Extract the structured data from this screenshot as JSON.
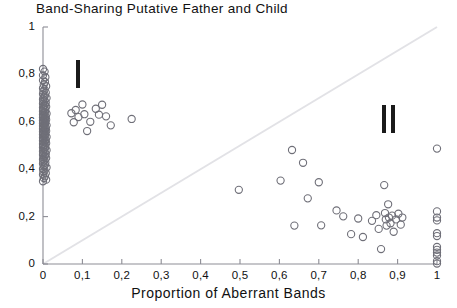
{
  "chart_data": {
    "type": "scatter",
    "title": "Band-Sharing Putative Father and Child",
    "xlabel": "Proportion of Aberrant Bands",
    "ylabel": "",
    "xlim": [
      0,
      1
    ],
    "ylim": [
      0,
      1
    ],
    "grid": false,
    "legend": "none",
    "xticks": [
      0,
      0.1,
      0.2,
      0.3,
      0.4,
      0.5,
      0.6,
      0.7,
      0.8,
      0.9,
      1
    ],
    "xticklabels": [
      "0",
      "0,1",
      "0,2",
      "0,3",
      "0,4",
      "0,5",
      "0,6",
      "0,7",
      "0,8",
      "0,9",
      "1"
    ],
    "yticks": [
      0,
      0.2,
      0.4,
      0.6,
      0.8,
      1
    ],
    "yticklabels": [
      "0",
      "0,2",
      "0,4",
      "0,6",
      "0,8",
      "1"
    ],
    "marker": "open-circle",
    "marker_color": "#6f6f78",
    "annotations": [
      {
        "text": "I",
        "bars": 1,
        "x": 0.09,
        "y": 0.8,
        "name": "cluster-label-i"
      },
      {
        "text": "II",
        "bars": 2,
        "x": 0.875,
        "y": 0.61,
        "name": "cluster-label-ii"
      }
    ],
    "reference_line": {
      "name": "diagonal-reference-line",
      "from": [
        0,
        0
      ],
      "to": [
        1,
        1
      ],
      "color": "#e2e2e6"
    },
    "series": [
      {
        "name": "putative father-child pairs",
        "points": [
          [
            0.0,
            0.823
          ],
          [
            0.004,
            0.812
          ],
          [
            0.0,
            0.796
          ],
          [
            0.006,
            0.788
          ],
          [
            0.0,
            0.775
          ],
          [
            0.005,
            0.768
          ],
          [
            0.002,
            0.757
          ],
          [
            0.008,
            0.75
          ],
          [
            0.0,
            0.742
          ],
          [
            0.004,
            0.736
          ],
          [
            0.001,
            0.729
          ],
          [
            0.007,
            0.723
          ],
          [
            0.0,
            0.717
          ],
          [
            0.005,
            0.711
          ],
          [
            0.002,
            0.705
          ],
          [
            0.009,
            0.7
          ],
          [
            0.0,
            0.695
          ],
          [
            0.004,
            0.69
          ],
          [
            0.001,
            0.685
          ],
          [
            0.007,
            0.681
          ],
          [
            0.0,
            0.676
          ],
          [
            0.005,
            0.672
          ],
          [
            0.002,
            0.668
          ],
          [
            0.008,
            0.664
          ],
          [
            0.0,
            0.66
          ],
          [
            0.004,
            0.656
          ],
          [
            0.001,
            0.652
          ],
          [
            0.006,
            0.648
          ],
          [
            0.0,
            0.645
          ],
          [
            0.005,
            0.641
          ],
          [
            0.002,
            0.638
          ],
          [
            0.009,
            0.634
          ],
          [
            0.0,
            0.631
          ],
          [
            0.004,
            0.628
          ],
          [
            0.001,
            0.624
          ],
          [
            0.007,
            0.621
          ],
          [
            0.0,
            0.618
          ],
          [
            0.005,
            0.615
          ],
          [
            0.002,
            0.612
          ],
          [
            0.008,
            0.609
          ],
          [
            0.0,
            0.606
          ],
          [
            0.004,
            0.603
          ],
          [
            0.001,
            0.6
          ],
          [
            0.006,
            0.597
          ],
          [
            0.0,
            0.594
          ],
          [
            0.005,
            0.591
          ],
          [
            0.002,
            0.588
          ],
          [
            0.009,
            0.585
          ],
          [
            0.0,
            0.582
          ],
          [
            0.004,
            0.579
          ],
          [
            0.001,
            0.576
          ],
          [
            0.007,
            0.573
          ],
          [
            0.0,
            0.57
          ],
          [
            0.005,
            0.567
          ],
          [
            0.002,
            0.564
          ],
          [
            0.008,
            0.561
          ],
          [
            0.0,
            0.558
          ],
          [
            0.004,
            0.555
          ],
          [
            0.001,
            0.552
          ],
          [
            0.006,
            0.549
          ],
          [
            0.0,
            0.546
          ],
          [
            0.005,
            0.543
          ],
          [
            0.002,
            0.54
          ],
          [
            0.009,
            0.536
          ],
          [
            0.0,
            0.533
          ],
          [
            0.004,
            0.53
          ],
          [
            0.001,
            0.527
          ],
          [
            0.007,
            0.523
          ],
          [
            0.0,
            0.52
          ],
          [
            0.005,
            0.517
          ],
          [
            0.002,
            0.513
          ],
          [
            0.008,
            0.51
          ],
          [
            0.0,
            0.506
          ],
          [
            0.004,
            0.503
          ],
          [
            0.001,
            0.499
          ],
          [
            0.006,
            0.495
          ],
          [
            0.0,
            0.492
          ],
          [
            0.005,
            0.488
          ],
          [
            0.002,
            0.484
          ],
          [
            0.009,
            0.48
          ],
          [
            0.0,
            0.476
          ],
          [
            0.004,
            0.472
          ],
          [
            0.001,
            0.468
          ],
          [
            0.007,
            0.464
          ],
          [
            0.0,
            0.46
          ],
          [
            0.005,
            0.456
          ],
          [
            0.002,
            0.451
          ],
          [
            0.008,
            0.447
          ],
          [
            0.0,
            0.442
          ],
          [
            0.004,
            0.438
          ],
          [
            0.001,
            0.433
          ],
          [
            0.006,
            0.428
          ],
          [
            0.0,
            0.423
          ],
          [
            0.005,
            0.418
          ],
          [
            0.002,
            0.412
          ],
          [
            0.009,
            0.407
          ],
          [
            0.0,
            0.401
          ],
          [
            0.004,
            0.395
          ],
          [
            0.001,
            0.389
          ],
          [
            0.007,
            0.383
          ],
          [
            0.0,
            0.377
          ],
          [
            0.005,
            0.37
          ],
          [
            0.002,
            0.363
          ],
          [
            0.008,
            0.356
          ],
          [
            0.0,
            0.349
          ],
          [
            0.072,
            0.636
          ],
          [
            0.078,
            0.598
          ],
          [
            0.083,
            0.65
          ],
          [
            0.09,
            0.62
          ],
          [
            0.1,
            0.673
          ],
          [
            0.105,
            0.632
          ],
          [
            0.112,
            0.561
          ],
          [
            0.12,
            0.6
          ],
          [
            0.134,
            0.655
          ],
          [
            0.142,
            0.63
          ],
          [
            0.15,
            0.672
          ],
          [
            0.16,
            0.623
          ],
          [
            0.172,
            0.585
          ],
          [
            0.225,
            0.612
          ],
          [
            0.497,
            0.313
          ],
          [
            0.603,
            0.352
          ],
          [
            0.632,
            0.481
          ],
          [
            0.638,
            0.162
          ],
          [
            0.66,
            0.427
          ],
          [
            0.672,
            0.277
          ],
          [
            0.7,
            0.345
          ],
          [
            0.706,
            0.163
          ],
          [
            0.745,
            0.226
          ],
          [
            0.762,
            0.201
          ],
          [
            0.782,
            0.126
          ],
          [
            0.8,
            0.192
          ],
          [
            0.812,
            0.114
          ],
          [
            0.835,
            0.182
          ],
          [
            0.846,
            0.206
          ],
          [
            0.852,
            0.148
          ],
          [
            0.858,
            0.063
          ],
          [
            0.866,
            0.333
          ],
          [
            0.868,
            0.215
          ],
          [
            0.87,
            0.188
          ],
          [
            0.872,
            0.162
          ],
          [
            0.876,
            0.252
          ],
          [
            0.878,
            0.196
          ],
          [
            0.882,
            0.172
          ],
          [
            0.886,
            0.204
          ],
          [
            0.89,
            0.136
          ],
          [
            0.896,
            0.188
          ],
          [
            0.902,
            0.212
          ],
          [
            0.908,
            0.166
          ],
          [
            0.912,
            0.196
          ],
          [
            1.0,
            0.487
          ],
          [
            1.0,
            0.222
          ],
          [
            1.0,
            0.196
          ],
          [
            1.0,
            0.184
          ],
          [
            1.0,
            0.13
          ],
          [
            1.0,
            0.118
          ],
          [
            1.0,
            0.072
          ],
          [
            1.0,
            0.06
          ],
          [
            1.0,
            0.048
          ],
          [
            1.0,
            0.036
          ],
          [
            1.0,
            0.012
          ],
          [
            1.0,
            0.002
          ]
        ]
      }
    ]
  }
}
